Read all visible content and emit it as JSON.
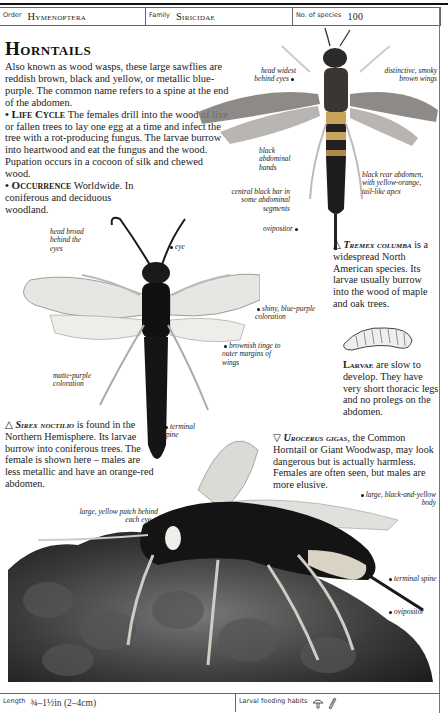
{
  "header": {
    "order_label": "Order",
    "order_value": "Hymenoptera",
    "family_label": "Family",
    "family_value": "Siricidae",
    "species_label": "No. of species",
    "species_value": "100"
  },
  "title": "Horntails",
  "intro": {
    "paragraph": "Also known as wood wasps, these large sawflies are reddish brown, black and yellow, or metallic blue-purple. The common name refers to a spine at the end of the abdomen.",
    "life_cycle_heading": "• Life Cycle",
    "life_cycle_text": "The females drill into the wood of live or fallen trees to lay one egg at a time and infect the tree with a rot-producing fungus. The larvae burrow into heartwood and eat the fungus and the wood. Pupation occurs in a cocoon of silk and chewed wood.",
    "occurrence_heading": "• Occurrence",
    "occurrence_text": "Worldwide. In coniferous and deciduous woodland."
  },
  "tremex": {
    "labels": {
      "head": "head widest behind eyes",
      "wings": "distinctive, smoky brown wings",
      "bands": "black abdominal bands",
      "bar": "central black bar in some abdominal segments",
      "rear": "black rear abdomen, with yellow-orange, tail-like apex",
      "ovipositor": "ovipositor"
    },
    "caption_marker": "△",
    "caption_species": "Tremex columba",
    "caption_text": "is a widespread North American species. Its larvae usually burrow into the wood of maple and oak trees."
  },
  "larvae": {
    "heading": "Larvae",
    "text": "are slow to develop. They have very short thoracic legs and no prolegs on the abdomen."
  },
  "sirex": {
    "labels": {
      "head": "head broad behind the eyes",
      "eye": "eye",
      "shiny": "shiny, blue-purple coloration",
      "tinge": "brownish tinge to outer margins of wings",
      "matte": "matte-purple coloration",
      "spine": "terminal spine"
    },
    "caption_marker": "△",
    "caption_species": "Sirex noctilio",
    "caption_text": "is found in the Northern Hemisphere. Its larvae burrow into coniferous trees. The female is shown here – males are less metallic and have an orange-red abdomen."
  },
  "urocerus": {
    "labels": {
      "patch": "large, yellow patch behind each eye",
      "body": "large, black-and-yellow body",
      "spine": "terminal spine",
      "ovipositor": "ovipositor"
    },
    "caption_marker": "▽",
    "caption_species": "Urocerus gigas",
    "caption_text": ", the Common Horntail or Giant Woodwasp, may look dangerous but is actually harmless. Females are often seen, but males are more elusive."
  },
  "footer": {
    "length_label": "Length",
    "length_value": "¾–1½in (2–4cm)",
    "feeding_label": "Larval feeding habits",
    "feeding_icons": [
      "fungus-icon",
      "wood-icon"
    ]
  }
}
